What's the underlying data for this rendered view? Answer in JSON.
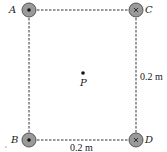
{
  "diagram": {
    "type": "square-wire-arrangement",
    "points": [
      {
        "id": "A",
        "label": "A",
        "symbol": "dot",
        "direction": "out-of-page",
        "x": 29,
        "y": 10
      },
      {
        "id": "C",
        "label": "C",
        "symbol": "cross",
        "direction": "into-page",
        "x": 136,
        "y": 10
      },
      {
        "id": "B",
        "label": "B",
        "symbol": "dot",
        "direction": "out-of-page",
        "x": 29,
        "y": 140
      },
      {
        "id": "D",
        "label": "D",
        "symbol": "cross",
        "direction": "into-page",
        "x": 136,
        "y": 140
      }
    ],
    "center": {
      "label": "P",
      "x": 83,
      "y": 73
    },
    "dimensions": {
      "right_side": "0.2 m",
      "bottom_side": "0.2 m"
    },
    "colors": {
      "wire_fill": "#9a9a9a",
      "wire_stroke": "#555555",
      "line": "#333333"
    }
  }
}
